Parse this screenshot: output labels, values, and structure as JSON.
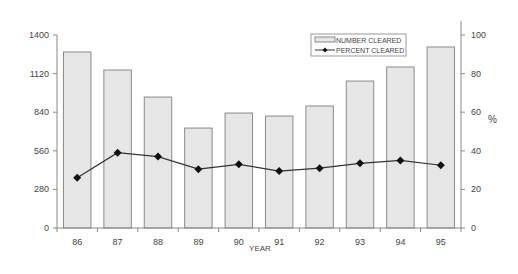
{
  "chart_data": {
    "type": "bar",
    "title": "",
    "xlabel": "YEAR",
    "ylabel": "",
    "y2label": "%",
    "categories": [
      "86",
      "87",
      "88",
      "89",
      "90",
      "91",
      "92",
      "93",
      "94",
      "95"
    ],
    "series": [
      {
        "name": "NUMBER CLEARED",
        "type": "bar",
        "axis": "left",
        "values": [
          1277,
          1146,
          950,
          725,
          834,
          812,
          885,
          1066,
          1168,
          1313
        ]
      },
      {
        "name": "PERCENT CLEARED",
        "type": "line",
        "axis": "right",
        "marker": "diamond",
        "values": [
          26,
          39,
          37,
          30.5,
          33,
          29.5,
          31,
          33.5,
          35,
          32.5
        ]
      }
    ],
    "ylim": [
      0,
      1400
    ],
    "yticks": [
      0,
      280,
      560,
      840,
      1120,
      1400
    ],
    "y2lim": [
      0,
      100
    ],
    "y2ticks": [
      0,
      20,
      40,
      60,
      80,
      100
    ],
    "grid": false,
    "legend_position": "top-right-inside"
  },
  "colors": {
    "bar_fill": "#e6e6e6",
    "bar_stroke": "#8a8a8a",
    "line": "#333333",
    "marker": "#111111",
    "axis": "#888888",
    "text": "#444444"
  }
}
